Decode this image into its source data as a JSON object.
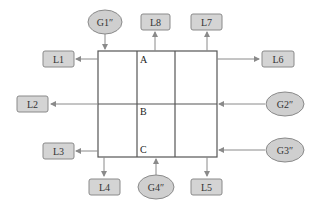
{
  "diagram": {
    "colors": {
      "box_fill": "#d4d4d4",
      "box_stroke": "#8a8a8a",
      "ellipse_fill": "#cfcfcf",
      "grid_stroke": "#555555",
      "arrow": "#8a8a8a"
    },
    "grid": {
      "cells": [
        {
          "id": "A",
          "label": "A"
        },
        {
          "id": "B",
          "label": "B"
        },
        {
          "id": "C",
          "label": "C"
        }
      ]
    },
    "outputs": [
      {
        "id": "L1",
        "label": "L1"
      },
      {
        "id": "L2",
        "label": "L2"
      },
      {
        "id": "L3",
        "label": "L3"
      },
      {
        "id": "L4",
        "label": "L4"
      },
      {
        "id": "L5",
        "label": "L5"
      },
      {
        "id": "L6",
        "label": "L6"
      },
      {
        "id": "L7",
        "label": "L7"
      },
      {
        "id": "L8",
        "label": "L8"
      }
    ],
    "inputs": [
      {
        "id": "G1",
        "label": "G1″"
      },
      {
        "id": "G2",
        "label": "G2″"
      },
      {
        "id": "G3",
        "label": "G3″"
      },
      {
        "id": "G4",
        "label": "G4″"
      }
    ]
  }
}
